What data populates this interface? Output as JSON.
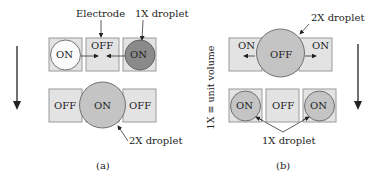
{
  "colors": {
    "electrode_fill": "#e3e3e3",
    "electrode_stroke": "#9a9a9a",
    "droplet_light": "#fafafa",
    "droplet_dark": "#8a8a8a",
    "droplet_mid": "#c4c4c4",
    "line": "#333333"
  },
  "panel_a": {
    "caption": "(a)",
    "labels": {
      "electrode": "Electrode",
      "droplet_1x": "1X droplet",
      "droplet_2x": "2X droplet"
    },
    "top_row": [
      {
        "state": "ON",
        "droplet": "light"
      },
      {
        "state": "OFF",
        "droplet": "none"
      },
      {
        "state": "ON",
        "droplet": "dark"
      }
    ],
    "bottom_row": [
      {
        "state": "OFF"
      },
      {
        "state": "ON",
        "droplet": "2X"
      },
      {
        "state": "OFF"
      }
    ]
  },
  "panel_b": {
    "caption": "(b)",
    "labels": {
      "droplet_2x": "2X droplet",
      "droplet_1x": "1X droplet"
    },
    "top_row": [
      {
        "state": "ON"
      },
      {
        "state": "OFF",
        "droplet": "2X"
      },
      {
        "state": "ON"
      }
    ],
    "bottom_row": [
      {
        "state": "ON",
        "droplet": "1X"
      },
      {
        "state": "OFF"
      },
      {
        "state": "ON",
        "droplet": "1X"
      }
    ]
  },
  "side_note": "1X ≡ unit volume"
}
